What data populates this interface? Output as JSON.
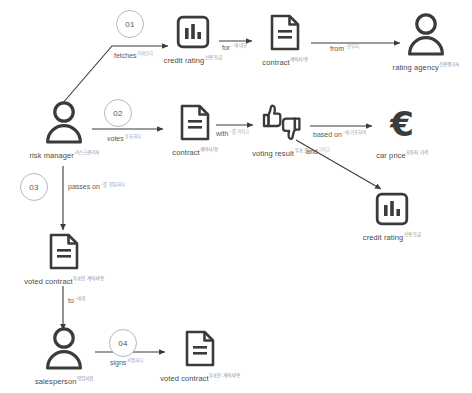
{
  "diagram": {
    "type": "process-flow",
    "stroke_color": "#3b3b3b",
    "label_color": "#5a5a5a",
    "gloss_color": "#9a9a9a",
    "background": "#ffffff",
    "steps": [
      {
        "id": "01",
        "label": "01"
      },
      {
        "id": "02",
        "label": "02"
      },
      {
        "id": "03",
        "label": "03"
      },
      {
        "id": "04",
        "label": "04"
      }
    ],
    "nodes": [
      {
        "id": "risk-manager",
        "icon": "person-icon",
        "label": "risk manager",
        "gloss": "리스크관리자"
      },
      {
        "id": "credit-rating-top",
        "icon": "bar-chart-icon",
        "label": "credit rating",
        "gloss": "신용 등급"
      },
      {
        "id": "contract-top",
        "icon": "document-icon",
        "label": "contract",
        "gloss": "계약서/용"
      },
      {
        "id": "rating-agency",
        "icon": "person-icon",
        "label": "rating agency",
        "gloss": "신용평가사"
      },
      {
        "id": "contract-mid",
        "icon": "document-icon",
        "label": "contract",
        "gloss": "계약서/용"
      },
      {
        "id": "voting-result",
        "icon": "thumbs-vote-icon",
        "label": "voting result",
        "gloss": "투표 결과"
      },
      {
        "id": "car-price",
        "icon": "euro-icon",
        "label": "car price",
        "gloss": "자동차 가격"
      },
      {
        "id": "credit-rating-bot",
        "icon": "bar-chart-icon",
        "label": "credit rating",
        "gloss": "신용 등급"
      },
      {
        "id": "voted-contract-mid",
        "icon": "document-icon",
        "label": "voted contract",
        "gloss": "투표된 계약서/용"
      },
      {
        "id": "salesperson",
        "icon": "person-icon",
        "label": "salesperson",
        "gloss": "영업사원"
      },
      {
        "id": "voted-contract-bot",
        "icon": "document-icon",
        "label": "voted contract",
        "gloss": "투표된 계약서/용"
      }
    ],
    "edges": [
      {
        "id": "fetches",
        "label": "fetches",
        "gloss": "가져오다",
        "from": "risk-manager",
        "to": "credit-rating-top"
      },
      {
        "id": "for",
        "label": "for",
        "gloss": "~에 대한",
        "from": "credit-rating-top",
        "to": "contract-top"
      },
      {
        "id": "from",
        "label": "from",
        "gloss": "~로부터",
        "from": "contract-top",
        "to": "rating-agency"
      },
      {
        "id": "votes",
        "label": "votes",
        "gloss": "투표하다",
        "from": "risk-manager",
        "to": "contract-mid"
      },
      {
        "id": "with",
        "label": "with",
        "gloss": "~를 가지고",
        "from": "contract-mid",
        "to": "voting-result"
      },
      {
        "id": "based-on",
        "label": "based on",
        "gloss": "~에 기초하여",
        "from": "voting-result",
        "to": "car-price"
      },
      {
        "id": "and",
        "label": "and",
        "gloss": "그리고",
        "from": "voting-result",
        "to": "credit-rating-bot"
      },
      {
        "id": "passes-on",
        "label": "passes on",
        "gloss": "~를 전달하다",
        "from": "risk-manager",
        "to": "voted-contract-mid"
      },
      {
        "id": "to",
        "label": "to",
        "gloss": "~에게",
        "from": "voted-contract-mid",
        "to": "salesperson"
      },
      {
        "id": "signs",
        "label": "signs",
        "gloss": "서명하다",
        "from": "salesperson",
        "to": "voted-contract-bot"
      }
    ]
  }
}
